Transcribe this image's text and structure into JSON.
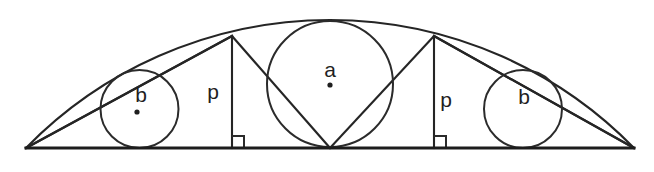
{
  "figure": {
    "background_color": "#ffffff",
    "stroke_color": "#2b2b2b",
    "width": 654,
    "height": 172
  },
  "labels": {
    "center_circle": "a",
    "left_small_circle": "b",
    "right_small_circle": "b",
    "left_triangle": "p",
    "right_triangle": "p"
  },
  "geometry": {
    "baseline": {
      "y": 148,
      "x_start": 26,
      "x_end": 634
    },
    "arc": {
      "apex_x": 330,
      "apex_y": 20,
      "left_x": 26,
      "right_x": 634
    },
    "circle_a": {
      "cx": 330,
      "cy": 84,
      "r": 63
    },
    "circle_b_left": {
      "cx": 139.5,
      "cy": 109,
      "r": 39
    },
    "circle_b_right": {
      "cx": 523,
      "cy": 109,
      "r": 39
    },
    "triangle_left": {
      "apex_x": 232,
      "apex_y": 36,
      "base_left_x": 26,
      "base_right_x": 330
    },
    "triangle_right": {
      "apex_x": 434,
      "apex_y": 36,
      "base_left_x": 330,
      "base_right_x": 634
    },
    "right_angle_marker_size": 12
  },
  "label_positions": {
    "a": {
      "x": 330,
      "y": 71
    },
    "a_dot": {
      "x": 330,
      "y": 85
    },
    "b_left": {
      "x": 141,
      "y": 96
    },
    "b_left_dot": {
      "x": 137,
      "y": 112
    },
    "b_right": {
      "x": 524,
      "y": 98
    },
    "p_left": {
      "x": 213,
      "y": 93
    },
    "p_right": {
      "x": 446,
      "y": 101
    }
  }
}
